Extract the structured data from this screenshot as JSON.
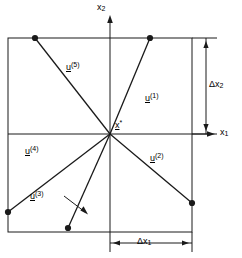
{
  "figure": {
    "type": "vector-diagram",
    "background_color": "#ffffff",
    "stroke_color": "#1a1a1a",
    "axes": {
      "x_axis_label": "x",
      "x_axis_subscript": "1",
      "y_axis_label": "x",
      "y_axis_subscript": "2"
    },
    "center_point": {
      "label": "x",
      "superscript": "*",
      "x": 110,
      "y": 134
    },
    "box": {
      "left": 8,
      "top": 38,
      "right": 192,
      "bottom": 232
    },
    "dimensions": [
      {
        "name": "delta-x2",
        "label": "Δx",
        "subscript": "2",
        "orientation": "vertical"
      },
      {
        "name": "delta-x1",
        "label": "Δx",
        "subscript": "1",
        "orientation": "horizontal"
      }
    ],
    "vectors": [
      {
        "id": "u1",
        "label": "u",
        "superscript": "(1)",
        "tip_x": 150,
        "tip_y": 38,
        "label_x": 145,
        "label_y": 92
      },
      {
        "id": "u2",
        "label": "u",
        "superscript": "(2)",
        "tip_x": 192,
        "tip_y": 203,
        "label_x": 150,
        "label_y": 152
      },
      {
        "id": "u3",
        "label": "u",
        "superscript": "(3)",
        "tip_x": 68,
        "tip_y": 228,
        "label_x": 30,
        "label_y": 190
      },
      {
        "id": "u4",
        "label": "u",
        "superscript": "(4)",
        "tip_x": 8,
        "tip_y": 212,
        "label_x": 25,
        "label_y": 145
      },
      {
        "id": "u5",
        "label": "u",
        "superscript": "(5)",
        "tip_x": 35,
        "tip_y": 38,
        "label_x": 66,
        "label_y": 61
      }
    ],
    "leader_line": {
      "from_x": 64,
      "from_y": 196,
      "to_x": 86,
      "to_y": 213
    }
  }
}
